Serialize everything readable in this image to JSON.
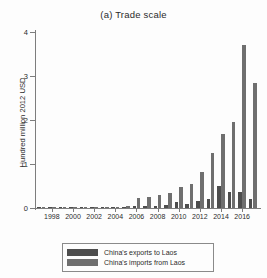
{
  "figure": {
    "title": "(a) Trade scale"
  },
  "chart_data": {
    "type": "bar",
    "title": "(a) Trade scale",
    "xlabel": "",
    "ylabel": "Hundred million 2012 USD",
    "ylim": [
      0,
      4
    ],
    "yticks": [
      0,
      1,
      2,
      3,
      4
    ],
    "ytick_labels": [
      "0",
      "1",
      "2",
      "3",
      "4"
    ],
    "grid": false,
    "legend_position": "bottom",
    "categories": [
      1997,
      1998,
      1999,
      2000,
      2001,
      2002,
      2003,
      2004,
      2005,
      2006,
      2007,
      2008,
      2009,
      2010,
      2011,
      2012,
      2013,
      2014,
      2015,
      2016,
      2017
    ],
    "xtick_labels": [
      "1998",
      "2000",
      "2002",
      "2004",
      "2006",
      "2008",
      "2010",
      "2012",
      "2014",
      "2016"
    ],
    "xticks": [
      1998,
      2000,
      2002,
      2004,
      2006,
      2008,
      2010,
      2012,
      2014,
      2016
    ],
    "series": [
      {
        "name": "China's exports to Laos",
        "color": "#4d4d4d",
        "values": [
          0.01,
          0.02,
          0.01,
          0.01,
          0.01,
          0.01,
          0.01,
          0.02,
          0.03,
          0.05,
          0.04,
          0.04,
          0.06,
          0.13,
          0.09,
          0.17,
          0.21,
          0.51,
          0.37,
          0.36,
          0.2
        ]
      },
      {
        "name": "China's imports from Laos",
        "color": "#6f6f6f",
        "values": [
          0.01,
          0.01,
          0.01,
          0.01,
          0.01,
          0.02,
          0.02,
          0.02,
          0.05,
          0.22,
          0.25,
          0.29,
          0.35,
          0.47,
          0.54,
          0.82,
          1.24,
          1.68,
          1.96,
          3.7,
          2.84
        ]
      }
    ]
  },
  "legend": {
    "items": [
      {
        "label": "China's exports to Laos",
        "color": "#4d4d4d"
      },
      {
        "label": "China's imports from Laos",
        "color": "#6f6f6f"
      }
    ]
  }
}
